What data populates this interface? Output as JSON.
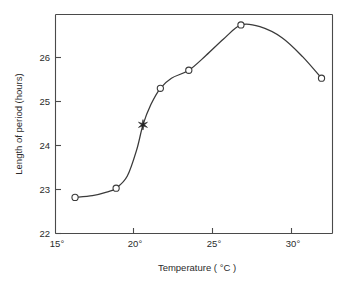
{
  "chart_data": {
    "type": "line",
    "title": "",
    "subtitle": "",
    "xlabel": "Temperature ( °C )",
    "ylabel": "Length of period (hours)",
    "xlim": [
      15,
      32.8
    ],
    "ylim": [
      22,
      26.9
    ],
    "grid": false,
    "legend": "none",
    "x_ticks": [
      15,
      20,
      25,
      30
    ],
    "x_tick_labels": [
      "15°",
      "20°",
      "25°",
      "30°"
    ],
    "y_ticks": [
      22,
      23,
      24,
      25,
      26
    ],
    "y_tick_labels": [
      "22",
      "23",
      "24",
      "25",
      "26"
    ],
    "series": [
      {
        "name": "open-circle observations",
        "marker": "open-circle",
        "x": [
          16.3,
          18.9,
          21.7,
          23.5,
          26.8,
          31.9
        ],
        "y": [
          22.82,
          23.03,
          25.3,
          25.71,
          26.74,
          25.53
        ]
      },
      {
        "name": "filled-star observation",
        "marker": "filled-star",
        "x": [
          20.6
        ],
        "y": [
          24.47
        ]
      }
    ],
    "curve": {
      "name": "fitted smooth curve",
      "x": [
        16.3,
        17.4,
        18.3,
        18.9,
        19.6,
        20.2,
        20.6,
        21.1,
        21.7,
        22.4,
        23.5,
        24.6,
        25.7,
        26.8,
        28.0,
        29.4,
        30.7,
        31.9
      ],
      "y": [
        22.82,
        22.86,
        22.94,
        23.03,
        23.3,
        23.9,
        24.47,
        24.93,
        25.3,
        25.53,
        25.71,
        26.05,
        26.42,
        26.74,
        26.7,
        26.45,
        26.02,
        25.53
      ]
    },
    "colors": {
      "axis": "#4a4a4a",
      "curve": "#3a3a3a",
      "marker_fill": "#ffffff",
      "marker_stroke": "#3a3a3a",
      "star": "#232323",
      "text": "#2b2b2b",
      "background": "#ffffff"
    }
  },
  "axes": {
    "x_title": "Temperature ( °C )",
    "y_title": "Length of period (hours)"
  }
}
